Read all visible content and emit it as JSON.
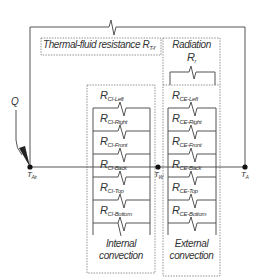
{
  "thermal_fluid": {
    "label": "Thermal-fluid resistance R",
    "sub": "T-f"
  },
  "radiation": {
    "title": "Radiation",
    "resistor": "R",
    "resistor_sub": "r"
  },
  "q_label": "Q",
  "nodes": {
    "air": {
      "main": "T",
      "sub": "Air"
    },
    "wall": {
      "main": "T",
      "sub": "W"
    },
    "ambient": {
      "main": "T",
      "sub": "A"
    }
  },
  "internal": {
    "caption_line1": "Internal",
    "caption_line2": "convection",
    "resistors": [
      {
        "main": "R",
        "sub": "CI-Left"
      },
      {
        "main": "R",
        "sub": "CI-Right"
      },
      {
        "main": "R",
        "sub": "CI-Front"
      },
      {
        "main": "R",
        "sub": "CI-Back"
      },
      {
        "main": "R",
        "sub": "CI-Top"
      },
      {
        "main": "R",
        "sub": "CI-Bottom"
      }
    ]
  },
  "external": {
    "caption_line1": "External",
    "caption_line2": "convection",
    "resistors": [
      {
        "main": "R",
        "sub": "CE-Left"
      },
      {
        "main": "R",
        "sub": "CE-Right"
      },
      {
        "main": "R",
        "sub": "CE-Front"
      },
      {
        "main": "R",
        "sub": "CE-Back"
      },
      {
        "main": "R",
        "sub": "CE-Top"
      },
      {
        "main": "R",
        "sub": "CE-Bottom"
      }
    ]
  }
}
